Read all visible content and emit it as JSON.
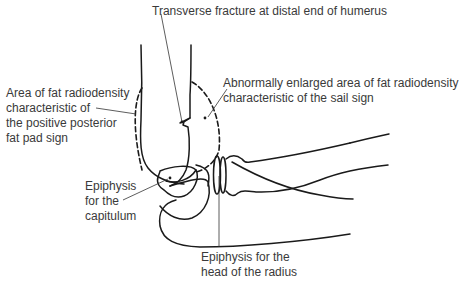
{
  "diagram": {
    "labels": {
      "fracture": {
        "lines": [
          "Transverse fracture at distal end of humerus"
        ]
      },
      "posterior_fat_pad": {
        "lines": [
          "Area of fat radiodensity",
          "characteristic of",
          "the positive posterior",
          "fat pad sign"
        ]
      },
      "sail_sign": {
        "lines": [
          "Abnormally enlarged area of fat radiodensity",
          "characteristic of the sail sign"
        ]
      },
      "capitulum": {
        "lines": [
          "Epiphysis",
          "for the",
          "capitulum"
        ]
      },
      "radial_head": {
        "lines": [
          "Epiphysis for the",
          "head of the radius"
        ]
      }
    },
    "colors": {
      "line": "#1a1a1a",
      "text": "#3a3a3a",
      "background": "#ffffff"
    }
  }
}
